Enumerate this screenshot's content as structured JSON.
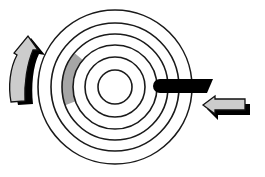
{
  "diagram": {
    "title": "",
    "tracks": {
      "count": 6
    },
    "highlighted_sector": {
      "track_index_from_center": 3,
      "label": "",
      "color": "#a6a6a6"
    },
    "read_write_head": {
      "color": "#000000"
    },
    "rotation_arrow": {
      "direction": "counterclockwise",
      "fill": "#cccccc",
      "shadow": "#000000"
    },
    "head_movement_arrow": {
      "direction": "inward",
      "fill": "#cccccc",
      "shadow": "#000000"
    },
    "colors": {
      "background": "#ffffff",
      "track_line": "#1a1a1a"
    }
  }
}
